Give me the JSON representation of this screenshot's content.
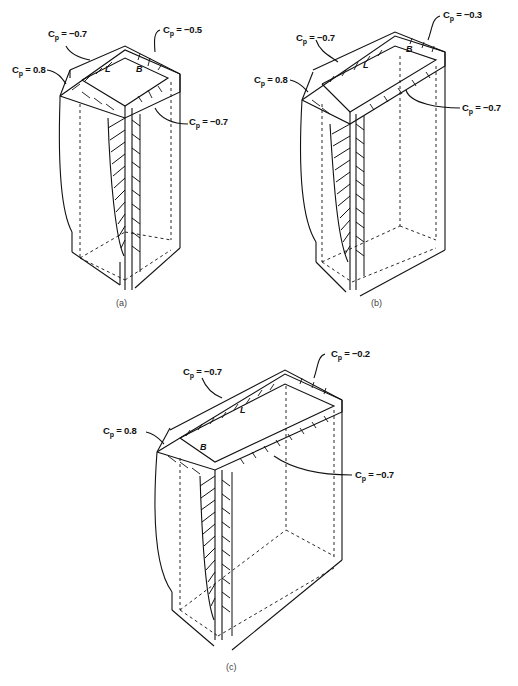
{
  "figure": {
    "panels": [
      {
        "id": "a",
        "caption": "(a)",
        "face_labels": {
          "long": "L",
          "short": "B"
        },
        "labels": [
          {
            "text": "Cp = 0.8",
            "target": "windward face"
          },
          {
            "text": "Cp = -0.7",
            "target": "side face (top-left)"
          },
          {
            "text": "Cp = -0.5",
            "target": "leeward face"
          },
          {
            "text": "Cp = -0.7",
            "target": "side face (bottom-right)"
          }
        ]
      },
      {
        "id": "b",
        "caption": "(b)",
        "face_labels": {
          "long": "L",
          "short": "B"
        },
        "labels": [
          {
            "text": "Cp = 0.8",
            "target": "windward face"
          },
          {
            "text": "Cp = -0.7",
            "target": "side face (top-left)"
          },
          {
            "text": "Cp = -0.3",
            "target": "leeward face"
          },
          {
            "text": "Cp = -0.7",
            "target": "side face (bottom-right)"
          }
        ]
      },
      {
        "id": "c",
        "caption": "(c)",
        "face_labels": {
          "long": "L",
          "short": "B"
        },
        "labels": [
          {
            "text": "Cp = 0.8",
            "target": "windward face"
          },
          {
            "text": "Cp = -0.7",
            "target": "side face (top-left)"
          },
          {
            "text": "Cp = -0.2",
            "target": "leeward face"
          },
          {
            "text": "Cp = -0.7",
            "target": "side face (bottom-right)"
          }
        ]
      }
    ],
    "cp_prefix": "C",
    "cp_sub": "p",
    "values": {
      "a": {
        "windward": "= 0.8",
        "side_tl": "= −0.7",
        "leeward": "= −0.5",
        "side_br": "= −0.7"
      },
      "b": {
        "windward": "= 0.8",
        "side_tl": "= −0.7",
        "leeward": "= −0.3",
        "side_br": "= −0.7"
      },
      "c": {
        "windward": "= 0.8",
        "side_tl": "= −0.7",
        "leeward": "= −0.2",
        "side_br": "= −0.7"
      }
    }
  }
}
